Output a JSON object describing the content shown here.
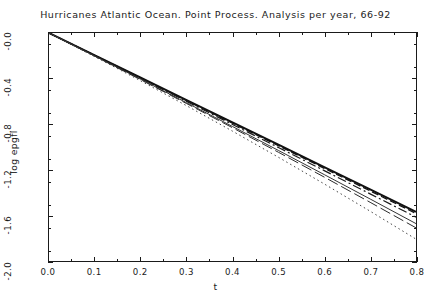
{
  "chart_data": {
    "type": "line",
    "title": "Hurricanes Atlantic Ocean. Point Process. Analysis per year, 66-92",
    "xlabel": "t",
    "ylabel": "log epgfl",
    "xlim": [
      0.0,
      0.8
    ],
    "ylim": [
      -2.0,
      0.0
    ],
    "xticks": [
      "0.0",
      "0.1",
      "0.2",
      "0.3",
      "0.4",
      "0.5",
      "0.6",
      "0.7",
      "0.8"
    ],
    "xtick_values": [
      0.0,
      0.1,
      0.2,
      0.3,
      0.4,
      0.5,
      0.6,
      0.7,
      0.8
    ],
    "yticks": [
      "-0.0",
      "-0.4",
      "-0.8",
      "-1.2",
      "-1.6",
      "-2.0"
    ],
    "ytick_values": [
      0.0,
      -0.4,
      -0.8,
      -1.2,
      -1.6,
      -2.0
    ],
    "minor_ticks": true,
    "grid": false,
    "legend": "none",
    "x": [
      0.0,
      0.1,
      0.2,
      0.3,
      0.4,
      0.5,
      0.6,
      0.7,
      0.8
    ],
    "series": [
      {
        "name": "empirical-pgfl-thick",
        "style": "solid",
        "width": 2.0,
        "color": "#111111",
        "values": [
          0.0,
          -0.196,
          -0.392,
          -0.588,
          -0.784,
          -0.98,
          -1.176,
          -1.372,
          -1.568
        ]
      },
      {
        "name": "fitted-model-dashed",
        "style": "dashed",
        "width": 1.3,
        "color": "#111111",
        "values": [
          0.0,
          -0.197,
          -0.395,
          -0.593,
          -0.791,
          -0.989,
          -1.187,
          -1.385,
          -1.583
        ]
      },
      {
        "name": "fitted-model-dashdot",
        "style": "dashdot",
        "width": 1.2,
        "color": "#1a1a1a",
        "values": [
          0.0,
          -0.199,
          -0.399,
          -0.6,
          -0.802,
          -1.004,
          -1.207,
          -1.411,
          -1.615
        ]
      },
      {
        "name": "simulation-solid-thin",
        "style": "solid",
        "width": 1.0,
        "color": "#333333",
        "values": [
          0.0,
          -0.202,
          -0.406,
          -0.612,
          -0.82,
          -1.03,
          -1.242,
          -1.456,
          -1.672
        ]
      },
      {
        "name": "simulation-longdash",
        "style": "longdash",
        "width": 1.0,
        "color": "#2a2a2a",
        "values": [
          0.0,
          -0.204,
          -0.41,
          -0.619,
          -0.831,
          -1.046,
          -1.264,
          -1.485,
          -1.709
        ]
      },
      {
        "name": "envelope-dotted",
        "style": "dotted",
        "width": 1.0,
        "color": "#444444",
        "values": [
          0.0,
          -0.208,
          -0.42,
          -0.638,
          -0.861,
          -1.09,
          -1.324,
          -1.563,
          -1.808
        ]
      }
    ]
  },
  "axis": {
    "x_title": "t",
    "y_title": "log epgfl"
  }
}
